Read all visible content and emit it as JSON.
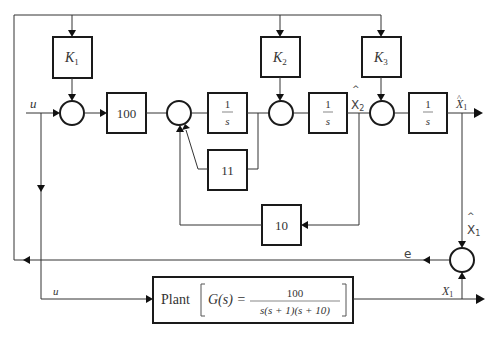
{
  "diagram": {
    "type": "block-diagram",
    "blocks": {
      "k1": {
        "label": "K",
        "sub": "1"
      },
      "k2": {
        "label": "K",
        "sub": "2"
      },
      "k3": {
        "label": "K",
        "sub": "3"
      },
      "gain100": {
        "label": "100"
      },
      "int1": {
        "num": "1",
        "den": "s"
      },
      "int2": {
        "num": "1",
        "den": "s"
      },
      "int3": {
        "num": "1",
        "den": "s"
      },
      "gain11": {
        "label": "11"
      },
      "gain10": {
        "label": "10"
      },
      "plant": {
        "label": "Plant",
        "lhs": "G(s) =",
        "num": "100",
        "den": "s(s + 1)(s + 10)"
      }
    },
    "signals": {
      "u_top": "u",
      "u_bottom": "u",
      "x2_hat": "X",
      "x2_hat_sub": "2",
      "x2_hat_hat": "^",
      "x1_hat_out": "X",
      "x1_hat_out_sub": "1",
      "x1_hat_vert": "X",
      "x1_hat_vert_sub": "1",
      "x1_hat_vert_hat": "^",
      "error": "e",
      "x1": "X",
      "x1_sub": "1"
    }
  }
}
